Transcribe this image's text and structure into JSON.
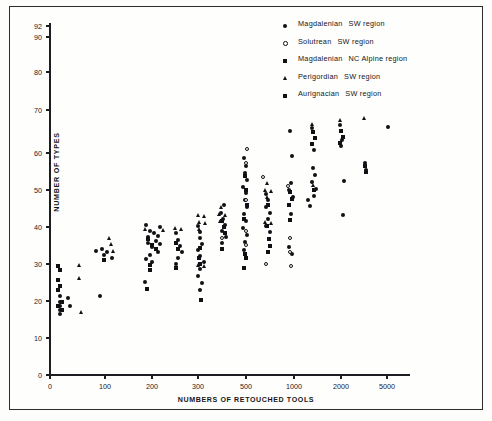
{
  "figure": {
    "background": "#fdfdfb",
    "ink": "#16161a"
  },
  "axes": {
    "ylabel": "NUMBER OF TYPES",
    "xlabel": "NUMBERS OF RETOUCHED TOOLS",
    "y_ticks": [
      0,
      10,
      20,
      30,
      40,
      50,
      60,
      70,
      80,
      90,
      92
    ],
    "x_ticks": [
      0,
      100,
      200,
      300,
      500,
      1000,
      2000,
      5000
    ],
    "x_scale": "log-like",
    "y_range": [
      0,
      92
    ],
    "grid": false
  },
  "legend": {
    "position": "top-right",
    "items": [
      {
        "marker": "filled-circle",
        "name": "Magdalenian",
        "region": "SW region"
      },
      {
        "marker": "open-circle",
        "name": "Solutrean",
        "region": "SW region"
      },
      {
        "marker": "filled-square",
        "name": "Magdalenian",
        "region": "NC Alpine region"
      },
      {
        "marker": "triangle",
        "name": "Perigordian",
        "region": "SW region"
      },
      {
        "marker": "filled-square",
        "name": "Aurignacian",
        "region": "SW region"
      }
    ]
  },
  "chart_data": {
    "type": "scatter",
    "title": "",
    "xlabel": "NUMBERS OF RETOUCHED TOOLS",
    "ylabel": "NUMBER OF TYPES",
    "xlim": [
      0,
      5000
    ],
    "ylim": [
      0,
      92
    ],
    "x_ticks": [
      0,
      100,
      200,
      300,
      500,
      1000,
      2000,
      5000
    ],
    "y_ticks": [
      0,
      10,
      20,
      30,
      40,
      50,
      60,
      70,
      80,
      90,
      92
    ],
    "x_tick_px": [
      50,
      105,
      152,
      198,
      246,
      294,
      341,
      387
    ],
    "y_tick_px": [
      375,
      338,
      301,
      264,
      227,
      190,
      153,
      110,
      72,
      37,
      26
    ],
    "series": [
      {
        "name": "Magdalenian SW region",
        "marker": "filled-circle",
        "points_px": [
          [
            60,
            296
          ],
          [
            60,
            302
          ],
          [
            60,
            306
          ],
          [
            60,
            310
          ],
          [
            60,
            314
          ],
          [
            68,
            298
          ],
          [
            70,
            306
          ],
          [
            96,
            251
          ],
          [
            102,
            249
          ],
          [
            104,
            255
          ],
          [
            107,
            252
          ],
          [
            112,
            258
          ],
          [
            100,
            296
          ],
          [
            148,
            237
          ],
          [
            148,
            243
          ],
          [
            150,
            231
          ],
          [
            152,
            247
          ],
          [
            154,
            233
          ],
          [
            156,
            241
          ],
          [
            158,
            236
          ],
          [
            160,
            244
          ],
          [
            150,
            255
          ],
          [
            158,
            252
          ],
          [
            146,
            259
          ],
          [
            152,
            262
          ],
          [
            146,
            225
          ],
          [
            160,
            227
          ],
          [
            145,
            282
          ],
          [
            176,
            233
          ],
          [
            178,
            240
          ],
          [
            180,
            246
          ],
          [
            182,
            252
          ],
          [
            178,
            258
          ],
          [
            176,
            264
          ],
          [
            198,
            226
          ],
          [
            200,
            232
          ],
          [
            200,
            238
          ],
          [
            202,
            244
          ],
          [
            198,
            250
          ],
          [
            200,
            256
          ],
          [
            204,
            262
          ],
          [
            200,
            269
          ],
          [
            198,
            276
          ],
          [
            202,
            283
          ],
          [
            200,
            290
          ],
          [
            221,
            213
          ],
          [
            223,
            219
          ],
          [
            225,
            225
          ],
          [
            222,
            231
          ],
          [
            224,
            205
          ],
          [
            226,
            237
          ],
          [
            222,
            243
          ],
          [
            244,
            158
          ],
          [
            246,
            166
          ],
          [
            245,
            173
          ],
          [
            247,
            180
          ],
          [
            243,
            187
          ],
          [
            246,
            193
          ],
          [
            245,
            200
          ],
          [
            247,
            207
          ],
          [
            244,
            214
          ],
          [
            246,
            221
          ],
          [
            243,
            228
          ],
          [
            247,
            235
          ],
          [
            245,
            242
          ],
          [
            244,
            250
          ],
          [
            266,
            194
          ],
          [
            268,
            200
          ],
          [
            266,
            207
          ],
          [
            270,
            213
          ],
          [
            268,
            219
          ],
          [
            266,
            226
          ],
          [
            270,
            232
          ],
          [
            290,
            131
          ],
          [
            292,
            156
          ],
          [
            291,
            183
          ],
          [
            289,
            190
          ],
          [
            293,
            197
          ],
          [
            291,
            214
          ],
          [
            289,
            247
          ],
          [
            292,
            254
          ],
          [
            312,
            128
          ],
          [
            314,
            150
          ],
          [
            313,
            168
          ],
          [
            315,
            175
          ],
          [
            312,
            182
          ],
          [
            316,
            189
          ],
          [
            314,
            196
          ],
          [
            340,
            125
          ],
          [
            342,
            140
          ],
          [
            341,
            146
          ],
          [
            344,
            181
          ],
          [
            343,
            215
          ],
          [
            365,
            163
          ],
          [
            366,
            170
          ],
          [
            388,
            127
          ],
          [
            310,
            206
          ],
          [
            308,
            200
          ]
        ]
      },
      {
        "name": "Solutrean SW region",
        "marker": "open-circle",
        "points_px": [
          [
            247,
            149
          ],
          [
            246,
            163
          ],
          [
            263,
            177
          ],
          [
            246,
            200
          ],
          [
            246,
            231
          ],
          [
            246,
            245
          ],
          [
            288,
            186
          ],
          [
            290,
            238
          ],
          [
            290,
            252
          ],
          [
            291,
            266
          ],
          [
            266,
            264
          ],
          [
            222,
            238
          ]
        ]
      },
      {
        "name": "Magdalenian NC Alpine region",
        "marker": "filled-square",
        "points_px": [
          [
            58,
            266
          ],
          [
            58,
            280
          ],
          [
            58,
            290
          ],
          [
            62,
            302
          ],
          [
            58,
            306
          ],
          [
            62,
            310
          ],
          [
            148,
            239
          ],
          [
            152,
            245
          ],
          [
            156,
            249
          ],
          [
            150,
            265
          ],
          [
            147,
            289
          ],
          [
            176,
            243
          ],
          [
            178,
            249
          ],
          [
            200,
            248
          ],
          [
            199,
            258
          ],
          [
            201,
            300
          ],
          [
            222,
            221
          ],
          [
            224,
            227
          ],
          [
            225,
            233
          ],
          [
            245,
            176
          ],
          [
            246,
            190
          ],
          [
            247,
            205
          ],
          [
            244,
            219
          ],
          [
            245,
            254
          ],
          [
            244,
            268
          ],
          [
            268,
            205
          ],
          [
            267,
            226
          ],
          [
            269,
            239
          ],
          [
            270,
            246
          ],
          [
            290,
            192
          ],
          [
            292,
            199
          ],
          [
            289,
            205
          ],
          [
            313,
            132
          ],
          [
            315,
            138
          ],
          [
            312,
            144
          ],
          [
            314,
            190
          ],
          [
            341,
            131
          ],
          [
            343,
            137
          ],
          [
            340,
            143
          ],
          [
            365,
            166
          ],
          [
            366,
            172
          ]
        ]
      },
      {
        "name": "Perigordian SW region",
        "marker": "triangle",
        "points_px": [
          [
            80,
            265
          ],
          [
            80,
            278
          ],
          [
            82,
            312
          ],
          [
            110,
            238
          ],
          [
            112,
            244
          ],
          [
            114,
            251
          ],
          [
            146,
            229
          ],
          [
            164,
            230
          ],
          [
            176,
            228
          ],
          [
            182,
            229
          ],
          [
            199,
            215
          ],
          [
            205,
            216
          ],
          [
            200,
            222
          ],
          [
            206,
            223
          ],
          [
            200,
            229
          ],
          [
            222,
            207
          ],
          [
            220,
            214
          ],
          [
            226,
            215
          ],
          [
            221,
            221
          ],
          [
            199,
            265
          ],
          [
            205,
            266
          ],
          [
            268,
            183
          ],
          [
            266,
            190
          ],
          [
            272,
            191
          ],
          [
            268,
            197
          ],
          [
            266,
            222
          ],
          [
            272,
            223
          ],
          [
            313,
            124
          ],
          [
            314,
            185
          ],
          [
            341,
            120
          ],
          [
            365,
            118
          ]
        ]
      },
      {
        "name": "Aurignacian SW region",
        "marker": "filled-square",
        "points_px": [
          [
            60,
            270
          ],
          [
            60,
            286
          ],
          [
            104,
            260
          ],
          [
            150,
            270
          ],
          [
            176,
            268
          ],
          [
            200,
            264
          ],
          [
            222,
            249
          ],
          [
            246,
            258
          ],
          [
            268,
            252
          ],
          [
            290,
            220
          ]
        ]
      }
    ]
  }
}
